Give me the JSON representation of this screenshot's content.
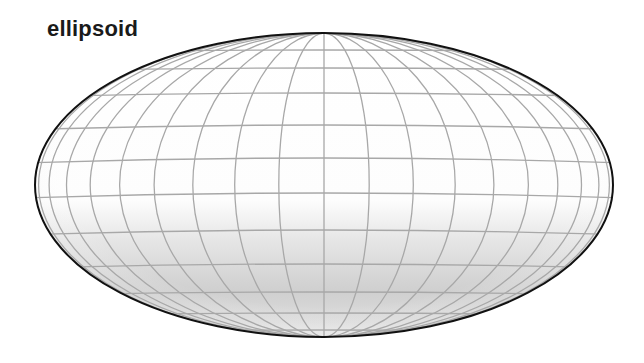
{
  "figure": {
    "title": "ellipsoid",
    "shape": "ellipsoid",
    "outline_color": "#111111",
    "grid_color": "#a8a8a8",
    "shade_light": "#ffffff",
    "shade_dark": "#cfcfcf",
    "ellipse": {
      "cx": 324,
      "cy": 185,
      "rx": 289,
      "ry": 152
    },
    "meridian_count": 20,
    "meridian_step_deg": 9,
    "parallels_y": [
      50,
      68,
      93,
      125,
      158,
      193,
      230,
      264,
      292,
      313,
      330
    ]
  }
}
